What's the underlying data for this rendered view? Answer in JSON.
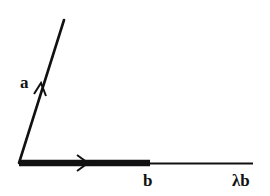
{
  "diagram": {
    "type": "vector-diagram",
    "colors": {
      "stroke": "#111111",
      "background": "#ffffff"
    },
    "origin": {
      "x": 19,
      "y": 163
    },
    "vectors": [
      {
        "id": "a",
        "label": "a",
        "start": [
          19,
          163
        ],
        "end": [
          64,
          20
        ],
        "arrow_at": [
          41,
          91
        ],
        "weight": "normal"
      },
      {
        "id": "b",
        "label": "b",
        "start": [
          19,
          163
        ],
        "end": [
          150,
          163
        ],
        "arrow_at": [
          86,
          163
        ],
        "weight": "thick"
      },
      {
        "id": "lambda_b",
        "label": "λb",
        "start": [
          150,
          163
        ],
        "end": [
          253,
          163
        ],
        "weight": "thin"
      }
    ],
    "labels": {
      "a": "a",
      "b": "b",
      "lambda_b": "λb"
    }
  }
}
